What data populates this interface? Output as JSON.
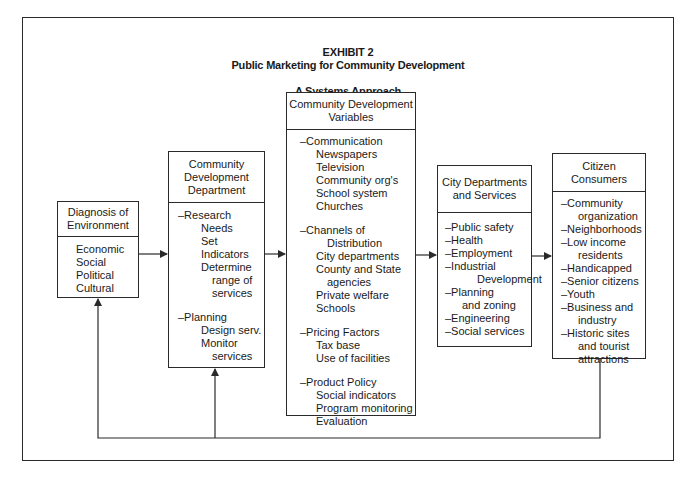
{
  "exhibit": {
    "label": "EXHIBIT  2",
    "title": "Public Marketing for Community Development",
    "subtitle": "A Systems Approach"
  },
  "boxes": {
    "diagnosis": {
      "header": [
        "Diagnosis of",
        "Environment"
      ],
      "items": [
        "Economic",
        "Social",
        "Political",
        "Cultural"
      ]
    },
    "department": {
      "header": [
        "Community",
        "Development",
        "Department"
      ],
      "research": "–Research",
      "research_items": [
        "Needs",
        "Set",
        "Indicators",
        "Determine",
        "range of",
        "services"
      ],
      "planning": "–Planning",
      "planning_items": [
        "Design serv.",
        "Monitor",
        "services"
      ]
    },
    "variables": {
      "header": [
        "Community Development",
        "Variables"
      ],
      "communication": "–Communication",
      "communication_items": [
        "Newspapers",
        "Television",
        "Community org's",
        "School system",
        "Churches"
      ],
      "channels": "–Channels of",
      "channels_items": [
        "Distribution",
        "City departments",
        "County and State",
        "agencies",
        "Private welfare",
        "Schools"
      ],
      "pricing": "–Pricing Factors",
      "pricing_items": [
        "Tax base",
        "Use of facilities"
      ],
      "product": "–Product Policy",
      "product_items": [
        "Social indicators",
        "Program monitoring",
        "Evaluation"
      ]
    },
    "city": {
      "header": [
        "City Departments",
        "and Services"
      ],
      "items": [
        "–Public safety",
        "–Health",
        "–Employment",
        "–Industrial",
        "Development",
        "–Planning",
        "and zoning",
        "–Engineering",
        "–Social services"
      ]
    },
    "citizens": {
      "header": [
        "Citizen",
        "Consumers"
      ],
      "items": [
        "–Community",
        "organization",
        "–Neighborhoods",
        "–Low income",
        "residents",
        "–Handicapped",
        "–Senior citizens",
        "–Youth",
        "–Business and",
        "industry",
        "–Historic sites",
        "and tourist",
        "attractions"
      ]
    }
  },
  "colors": {
    "line": "#2a2a2a",
    "background": "#ffffff",
    "text": "#1a1a1a"
  }
}
